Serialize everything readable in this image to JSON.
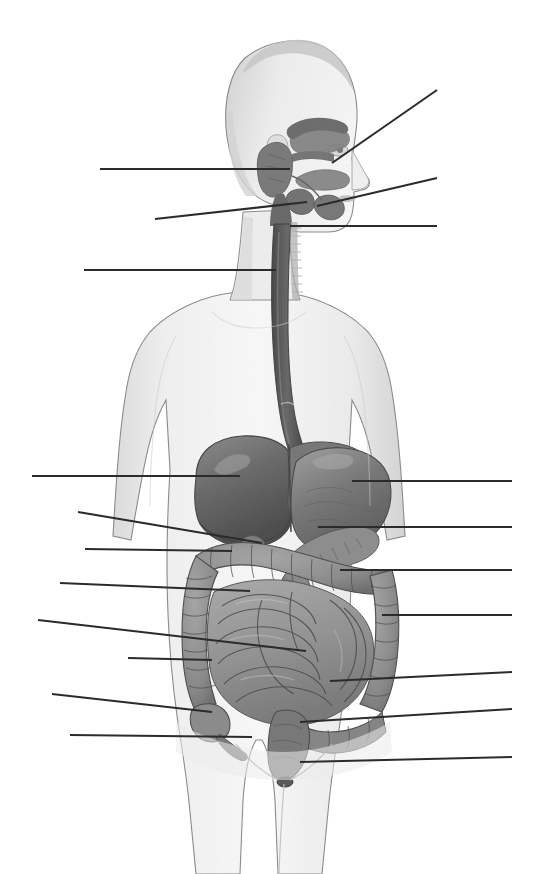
{
  "figure": {
    "title": "Digestive System",
    "subtitle": "Unlabeled anatomical diagram with blank leader lines",
    "view": "anterior male torso, head in profile",
    "style": "grayscale medical illustration, scanned halftone",
    "background_color": "#ffffff",
    "line_color": "#2b2b2b",
    "label_slots_total": 16,
    "label_slots_filled": 0,
    "label_text": ""
  },
  "palette": {
    "background": "#ffffff",
    "skin_light": "#f6f6f6",
    "skin_mid": "#e3e3e3",
    "skin_shade": "#cfcfcf",
    "outline": "#6f6f6f",
    "liver": "#6d6d6d",
    "liver_dark": "#565656",
    "liver_light": "#8a8a8a",
    "stomach": "#777777",
    "stomach_light": "#9c9c9c",
    "esophagus": "#5e5e5e",
    "pancreas": "#8f8f8f",
    "gallbladder": "#7b7b7b",
    "small_intestine": "#9a9a9a",
    "large_intestine": "#8d8d8d",
    "intestine_outline": "#4f4f4f",
    "rectum": "#7a7a7a",
    "salivary": "#7e7e7e",
    "oral_cavity": "#8b8b8b",
    "leader_line": "#2b2b2b"
  },
  "organs": [
    {
      "id": "parotid-gland",
      "name": "Parotid gland",
      "region": "head",
      "tone": "#7e7e7e"
    },
    {
      "id": "oral-cavity",
      "name": "Oral cavity / tongue",
      "region": "head",
      "tone": "#8b8b8b"
    },
    {
      "id": "sublingual-gland",
      "name": "Sublingual gland",
      "region": "head",
      "tone": "#7a7a7a"
    },
    {
      "id": "submandibular-gland",
      "name": "Submandibular gland",
      "region": "head",
      "tone": "#757575"
    },
    {
      "id": "pharynx",
      "name": "Pharynx",
      "region": "neck",
      "tone": "#6a6a6a"
    },
    {
      "id": "esophagus",
      "name": "Esophagus",
      "region": "thorax",
      "tone": "#5e5e5e"
    },
    {
      "id": "liver",
      "name": "Liver",
      "region": "abdomen",
      "tone": "#6d6d6d"
    },
    {
      "id": "stomach",
      "name": "Stomach",
      "region": "abdomen",
      "tone": "#777777"
    },
    {
      "id": "gallbladder",
      "name": "Gallbladder",
      "region": "abdomen",
      "tone": "#7b7b7b"
    },
    {
      "id": "pancreas",
      "name": "Pancreas",
      "region": "abdomen",
      "tone": "#8f8f8f"
    },
    {
      "id": "duodenum",
      "name": "Duodenum",
      "region": "abdomen",
      "tone": "#8a8a8a"
    },
    {
      "id": "transverse-colon",
      "name": "Transverse colon",
      "region": "abdomen",
      "tone": "#8d8d8d"
    },
    {
      "id": "ascending-colon",
      "name": "Ascending colon",
      "region": "abdomen",
      "tone": "#8d8d8d"
    },
    {
      "id": "descending-colon",
      "name": "Descending colon",
      "region": "abdomen",
      "tone": "#8d8d8d"
    },
    {
      "id": "small-intestine",
      "name": "Small intestine",
      "region": "abdomen",
      "tone": "#9a9a9a"
    },
    {
      "id": "cecum",
      "name": "Cecum",
      "region": "pelvis",
      "tone": "#8d8d8d"
    },
    {
      "id": "appendix",
      "name": "Appendix",
      "region": "pelvis",
      "tone": "#7a7a7a"
    },
    {
      "id": "sigmoid-colon",
      "name": "Sigmoid colon",
      "region": "pelvis",
      "tone": "#888888"
    },
    {
      "id": "rectum",
      "name": "Rectum",
      "region": "pelvis",
      "tone": "#7a7a7a"
    },
    {
      "id": "anus",
      "name": "Anus",
      "region": "pelvis",
      "tone": "#5e5e5e"
    }
  ],
  "leader_lines": [
    {
      "id": "L1",
      "side": "left",
      "label": "",
      "x1": 100,
      "y1": 169,
      "x2": 290,
      "y2": 169,
      "points_to": "parotid-gland"
    },
    {
      "id": "L2",
      "side": "left",
      "label": "",
      "x1": 155,
      "y1": 219,
      "x2": 307,
      "y2": 202,
      "points_to": "oral-cavity"
    },
    {
      "id": "L3",
      "side": "left",
      "label": "",
      "x1": 84,
      "y1": 270,
      "x2": 276,
      "y2": 270,
      "points_to": "pharynx"
    },
    {
      "id": "R1",
      "side": "right",
      "label": "",
      "x1": 332,
      "y1": 163,
      "x2": 437,
      "y2": 90,
      "points_to": "oral-cavity"
    },
    {
      "id": "R2",
      "side": "right",
      "label": "",
      "x1": 317,
      "y1": 206,
      "x2": 437,
      "y2": 178,
      "points_to": "sublingual-gland"
    },
    {
      "id": "R3",
      "side": "right",
      "label": "",
      "x1": 290,
      "y1": 226,
      "x2": 437,
      "y2": 226,
      "points_to": "submandibular-gland"
    },
    {
      "id": "L4",
      "side": "left",
      "label": "",
      "x1": 32,
      "y1": 476,
      "x2": 240,
      "y2": 476,
      "points_to": "liver"
    },
    {
      "id": "L5",
      "side": "left",
      "label": "",
      "x1": 78,
      "y1": 512,
      "x2": 262,
      "y2": 543,
      "points_to": "gallbladder"
    },
    {
      "id": "L6",
      "side": "left",
      "label": "",
      "x1": 85,
      "y1": 549,
      "x2": 232,
      "y2": 551,
      "points_to": "duodenum"
    },
    {
      "id": "L7",
      "side": "left",
      "label": "",
      "x1": 60,
      "y1": 583,
      "x2": 250,
      "y2": 591,
      "points_to": "ascending-colon"
    },
    {
      "id": "L8",
      "side": "left",
      "label": "",
      "x1": 38,
      "y1": 620,
      "x2": 306,
      "y2": 651,
      "points_to": "small-intestine"
    },
    {
      "id": "L9",
      "side": "left",
      "label": "",
      "x1": 128,
      "y1": 658,
      "x2": 212,
      "y2": 660,
      "points_to": "cecum"
    },
    {
      "id": "L10",
      "side": "left",
      "label": "",
      "x1": 52,
      "y1": 694,
      "x2": 212,
      "y2": 712,
      "points_to": "cecum"
    },
    {
      "id": "L11",
      "side": "left",
      "label": "",
      "x1": 70,
      "y1": 735,
      "x2": 252,
      "y2": 737,
      "points_to": "appendix"
    },
    {
      "id": "R4",
      "side": "right",
      "label": "",
      "x1": 352,
      "y1": 481,
      "x2": 512,
      "y2": 481,
      "points_to": "stomach"
    },
    {
      "id": "R5",
      "side": "right",
      "label": "",
      "x1": 318,
      "y1": 527,
      "x2": 512,
      "y2": 527,
      "points_to": "pancreas"
    },
    {
      "id": "R6",
      "side": "right",
      "label": "",
      "x1": 340,
      "y1": 570,
      "x2": 512,
      "y2": 570,
      "points_to": "transverse-colon"
    },
    {
      "id": "R7",
      "side": "right",
      "label": "",
      "x1": 382,
      "y1": 615,
      "x2": 512,
      "y2": 615,
      "points_to": "descending-colon"
    },
    {
      "id": "R8",
      "side": "right",
      "label": "",
      "x1": 330,
      "y1": 681,
      "x2": 512,
      "y2": 672,
      "points_to": "small-intestine"
    },
    {
      "id": "R9",
      "side": "right",
      "label": "",
      "x1": 300,
      "y1": 722,
      "x2": 512,
      "y2": 709,
      "points_to": "sigmoid-colon"
    },
    {
      "id": "R10",
      "side": "right",
      "label": "",
      "x1": 300,
      "y1": 762,
      "x2": 512,
      "y2": 757,
      "points_to": "anus"
    }
  ]
}
